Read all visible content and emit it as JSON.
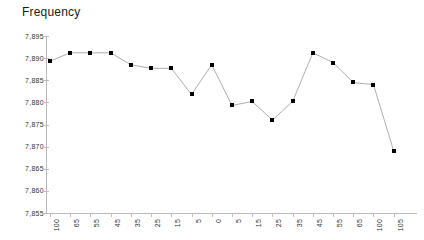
{
  "chart_data": {
    "type": "line",
    "title": "Frequency",
    "xlabel": "",
    "ylabel": "",
    "grid": false,
    "legend": "none",
    "marker": "square",
    "marker_color": "#000000",
    "line_color": "#999999",
    "axis_color": "#b8b8b8",
    "ylim": [
      7.855,
      7.895
    ],
    "ytick_labels": [
      "7,895",
      "7,890",
      "7,885",
      "7,880",
      "7,875",
      "7,870",
      "7,865",
      "7,860",
      "7,855"
    ],
    "ytick_values": [
      7.895,
      7.89,
      7.885,
      7.88,
      7.875,
      7.87,
      7.865,
      7.86,
      7.855
    ],
    "categories": [
      "100",
      "65",
      "55",
      "45",
      "35",
      "25",
      "15",
      "5",
      "0",
      "5",
      "15",
      "25",
      "35",
      "45",
      "55",
      "65",
      "100",
      "105"
    ],
    "values": [
      7.8893,
      7.8912,
      7.8912,
      7.8912,
      7.8885,
      7.8877,
      7.8877,
      7.8818,
      7.8885,
      7.8793,
      7.8802,
      7.876,
      7.8802,
      7.8912,
      7.889,
      7.8845,
      7.884,
      7.869
    ]
  }
}
